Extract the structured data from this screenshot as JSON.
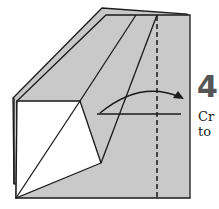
{
  "diagram": {
    "type": "origami-instruction-step",
    "step": {
      "number": "4",
      "text_lines": [
        "Cr",
        "to"
      ]
    },
    "colors": {
      "paper_colored": "#c8c8c8",
      "paper_white": "#ffffff",
      "line": "#1a1a1a",
      "step_number": "#555555"
    },
    "elements": [
      {
        "name": "back-layer",
        "kind": "polygon"
      },
      {
        "name": "front-layer",
        "kind": "polygon"
      },
      {
        "name": "white-flap",
        "kind": "polygon"
      },
      {
        "name": "crease-line-1",
        "kind": "line"
      },
      {
        "name": "crease-line-2",
        "kind": "line"
      },
      {
        "name": "valley-fold-dashed-line",
        "kind": "dashed-line"
      },
      {
        "name": "reference-horizontal-line",
        "kind": "line"
      },
      {
        "name": "fold-direction-arrow",
        "kind": "curved-arrow"
      }
    ]
  }
}
